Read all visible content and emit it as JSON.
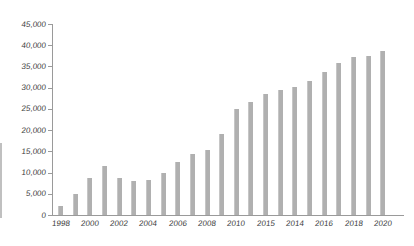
{
  "chart_data": {
    "type": "bar",
    "title": "",
    "xlabel": "",
    "ylabel": "",
    "categories": [
      "1998",
      "1999",
      "2000",
      "2001",
      "2002",
      "2003",
      "2004",
      "2005",
      "2006",
      "2007",
      "2008",
      "2009",
      "2010",
      "2011",
      "2012",
      "2013",
      "2014",
      "2015",
      "2016",
      "2017",
      "2018",
      "2019",
      "2020"
    ],
    "values": [
      2200,
      5000,
      8800,
      11500,
      8800,
      7900,
      8200,
      9900,
      12400,
      14400,
      15400,
      19100,
      25000,
      26600,
      28500,
      29400,
      30200,
      31600,
      33700,
      35800,
      37300,
      37500,
      38600
    ],
    "x_tick_labels_as_printed": [
      "1998",
      "2000",
      "2002",
      "2004",
      "2006",
      "2008",
      "2010",
      "2015",
      "2014",
      "2016",
      "2018",
      "2020"
    ],
    "x_tick_bar_indices": [
      0,
      2,
      4,
      6,
      8,
      10,
      12,
      14,
      16,
      18,
      20,
      22
    ],
    "y_ticks": [
      0,
      5000,
      10000,
      15000,
      20000,
      25000,
      30000,
      35000,
      40000,
      45000
    ],
    "y_tick_labels": [
      "0",
      "5,000",
      "10,000",
      "15,000",
      "20,000",
      "25,000",
      "30,000",
      "35,000",
      "40,000",
      "45,000"
    ],
    "ylim": [
      0,
      45000
    ],
    "grid": false,
    "legend": "none",
    "bar_color": "#b0b0b0",
    "axis_color": "#9a9a9a",
    "text_color": "#3b3b3b",
    "background_color": "#ffffff"
  }
}
